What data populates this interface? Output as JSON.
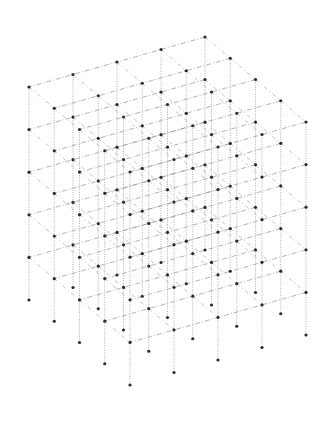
{
  "diagram": {
    "type": "isometric-3d-lattice",
    "grid": {
      "nodes_per_horizontal_axis_a": 5,
      "nodes_per_horizontal_axis_b": 5,
      "horizontal_layers": 5,
      "column_length_layers": 6
    },
    "projection": {
      "origin": [
        205,
        37
      ],
      "axis_a_step": [
        -44,
        12.5
      ],
      "axis_b_step": [
        25.25,
        21.25
      ],
      "axis_vertical_step": [
        0,
        42.6
      ]
    },
    "colors": {
      "background": "#ffffff",
      "node": "#2b2b2b",
      "vertical_edge": "#9a9a9a",
      "axis_a_edge": "#a0a0a0",
      "axis_b_edge": "#b4b4b4"
    },
    "node_radius": 1.6
  }
}
